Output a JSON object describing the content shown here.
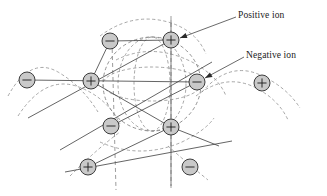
{
  "figure": {
    "kind": "ionic-crystal-lattice-diagram",
    "background_color": "#ffffff",
    "width": 327,
    "height": 196
  },
  "callouts": [
    {
      "id": "positive-ion",
      "label": "Positive ion",
      "label_x": 238,
      "label_y": 10,
      "leader_from_x": 236,
      "leader_from_y": 17,
      "leader_to_x": 180,
      "leader_to_y": 38
    },
    {
      "id": "negative-ion",
      "label": "Negative ion",
      "label_x": 246,
      "label_y": 50,
      "leader_from_x": 244,
      "leader_from_y": 57,
      "leader_to_x": 205,
      "leader_to_y": 78
    }
  ],
  "colors": {
    "ion_fill": "#c9c9c9",
    "ion_stroke": "#2a2a2a",
    "bond_stroke": "#3d3d3d",
    "dashed_stroke": "#8a8a8a",
    "label_text": "#1a1a1a"
  },
  "ions": [
    {
      "id": "ion-neg-top-left",
      "charge": "negative",
      "sign": "−",
      "cx": 110,
      "cy": 41,
      "r": 8.0
    },
    {
      "id": "ion-pos-top-center",
      "charge": "positive",
      "sign": "+",
      "cx": 171,
      "cy": 40,
      "r": 8.0
    },
    {
      "id": "ion-neg-far-left",
      "charge": "negative",
      "sign": "−",
      "cx": 27,
      "cy": 80,
      "r": 8.0
    },
    {
      "id": "ion-pos-mid-left",
      "charge": "positive",
      "sign": "+",
      "cx": 91,
      "cy": 81,
      "r": 8.0
    },
    {
      "id": "ion-neg-mid-right",
      "charge": "negative",
      "sign": "−",
      "cx": 197,
      "cy": 82,
      "r": 8.0
    },
    {
      "id": "ion-pos-far-right",
      "charge": "positive",
      "sign": "+",
      "cx": 262,
      "cy": 83,
      "r": 8.0
    },
    {
      "id": "ion-neg-lower-left",
      "charge": "negative",
      "sign": "−",
      "cx": 111,
      "cy": 126,
      "r": 8.0
    },
    {
      "id": "ion-pos-center",
      "charge": "positive",
      "sign": "+",
      "cx": 171,
      "cy": 127,
      "r": 8.0
    },
    {
      "id": "ion-pos-bottom-left",
      "charge": "positive",
      "sign": "+",
      "cx": 88,
      "cy": 167,
      "r": 8.0
    },
    {
      "id": "ion-neg-bottom-right",
      "charge": "negative",
      "sign": "−",
      "cx": 190,
      "cy": 167,
      "r": 8.0
    }
  ],
  "bonds": [
    {
      "id": "bond-upper-diag-left",
      "x1": 28,
      "y1": 118,
      "x2": 171,
      "y2": 40
    },
    {
      "id": "bond-lower-diag-left",
      "x1": 60,
      "y1": 150,
      "x2": 212,
      "y2": 62
    },
    {
      "id": "bond-left-rail",
      "x1": 27,
      "y1": 80,
      "x2": 197,
      "y2": 82
    },
    {
      "id": "bond-center-rail",
      "x1": 65,
      "y1": 172,
      "x2": 232,
      "y2": 141
    },
    {
      "id": "bond-cell-top",
      "x1": 110,
      "y1": 41,
      "x2": 171,
      "y2": 40
    },
    {
      "id": "bond-cell-left",
      "x1": 110,
      "y1": 41,
      "x2": 91,
      "y2": 81
    },
    {
      "id": "bond-cell-diag-a",
      "x1": 91,
      "y1": 81,
      "x2": 171,
      "y2": 127
    },
    {
      "id": "bond-cell-diag-b",
      "x1": 111,
      "y1": 126,
      "x2": 197,
      "y2": 82
    },
    {
      "id": "bond-vertical-top",
      "x1": 171,
      "y1": 20,
      "x2": 171,
      "y2": 127
    },
    {
      "id": "bond-vertical-bottom",
      "x1": 171,
      "y1": 127,
      "x2": 171,
      "y2": 186
    },
    {
      "id": "bond-center-to-right",
      "x1": 171,
      "y1": 127,
      "x2": 219,
      "y2": 146
    },
    {
      "id": "bond-center-to-bl",
      "x1": 171,
      "y1": 127,
      "x2": 88,
      "y2": 167
    }
  ],
  "dashed_circle": {
    "id": "central-dashed-sphere",
    "cx": 152,
    "cy": 84,
    "rx": 49,
    "ry": 47
  },
  "dashed_ellipses": [
    {
      "id": "dashed-ellipse-vertical-a",
      "cx": 152,
      "cy": 84,
      "rx": 18,
      "ry": 47,
      "rotate": 0
    },
    {
      "id": "dashed-ellipse-vertical-b",
      "cx": 152,
      "cy": 84,
      "rx": 34,
      "ry": 47,
      "rotate": 0
    },
    {
      "id": "dashed-ellipse-horizontal",
      "cx": 152,
      "cy": 84,
      "rx": 49,
      "ry": 17,
      "rotate": 0
    }
  ],
  "dashed_arcs": [
    {
      "id": "arc-left-outer",
      "d": "M 8 96 Q 30 56 58 72 Q 82 86 98 112"
    },
    {
      "id": "arc-left-lower",
      "d": "M 18 116 Q 44 76 76 86 Q 106 96 120 124"
    },
    {
      "id": "arc-right-outer",
      "d": "M 202 92 Q 228 62 258 74 Q 286 86 300 108"
    },
    {
      "id": "arc-right-lower",
      "d": "M 196 96 Q 224 74 252 86 Q 278 98 288 120"
    },
    {
      "id": "arc-top-over",
      "d": "M 100 36 Q 132 12 168 22 Q 196 30 206 54"
    },
    {
      "id": "arc-bottom-left",
      "d": "M 70 176 Q 98 148 120 132"
    },
    {
      "id": "arc-bottom-right",
      "d": "M 168 146 Q 186 162 208 180"
    },
    {
      "id": "arc-mid-sweep",
      "d": "M 116 60 Q 152 42 192 62 Q 218 76 226 96"
    },
    {
      "id": "arc-low-sweep",
      "d": "M 100 142 Q 140 160 182 142 Q 206 130 214 118"
    }
  ],
  "dashed_verticals": [
    {
      "id": "dash-vert-left",
      "x1": 112,
      "y1": 42,
      "x2": 116,
      "y2": 190
    },
    {
      "id": "dash-vert-right",
      "x1": 171,
      "y1": 16,
      "x2": 171,
      "y2": 190
    }
  ]
}
